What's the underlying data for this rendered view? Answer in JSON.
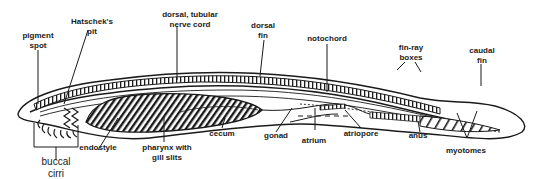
{
  "diagram": {
    "labels": {
      "pigment_spot": [
        "pigment",
        "spot"
      ],
      "hatscheks_pit": [
        "Hatschek's",
        "pit"
      ],
      "dorsal_nerve_cord": [
        "dorsal, tubular",
        "nerve cord"
      ],
      "dorsal_fin": [
        "dorsal",
        "fin"
      ],
      "notochord": [
        "notochord"
      ],
      "fin_ray_boxes": [
        "fin-ray",
        "boxes"
      ],
      "caudal_fin": [
        "caudal",
        "fin"
      ],
      "buccal_cirri": [
        "buccal",
        "cirri"
      ],
      "endostyle": [
        "endostyle"
      ],
      "pharynx": [
        "pharynx with",
        "gill slits"
      ],
      "cecum": [
        "cecum"
      ],
      "gonad": [
        "gonad"
      ],
      "atrium": [
        "atrium"
      ],
      "atriopore": [
        "atriopore"
      ],
      "anus": [
        "anus"
      ],
      "myotomes": [
        "myotomes"
      ]
    },
    "colors": {
      "line": "#1a1a1a",
      "background": "#ffffff"
    }
  }
}
